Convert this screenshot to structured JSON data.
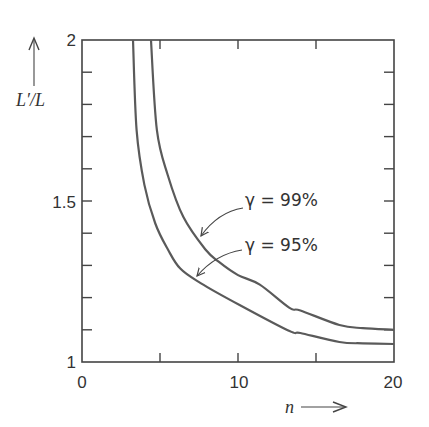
{
  "chart_data": {
    "type": "line",
    "title": "",
    "xlabel": "n",
    "ylabel": "L'/L",
    "xlim": [
      0,
      20
    ],
    "ylim": [
      1,
      2
    ],
    "x_ticks": [
      0,
      5,
      10,
      15,
      20
    ],
    "x_tick_labels": [
      "0",
      "",
      "10",
      "",
      "20"
    ],
    "y_ticks": [
      1,
      1.1,
      1.2,
      1.3,
      1.4,
      1.5,
      1.6,
      1.7,
      1.8,
      1.9,
      2
    ],
    "y_tick_labels": [
      "1",
      "",
      "",
      "",
      "",
      "1.5",
      "",
      "",
      "",
      "",
      "2"
    ],
    "grid": false,
    "legend": "none (inline annotations with arrows)",
    "series": [
      {
        "name": "γ = 99%",
        "x": [
          4.42,
          4.8,
          5.5,
          6.5,
          7.9,
          8.8,
          10,
          11.4,
          13.3,
          14,
          16.5,
          18,
          20
        ],
        "y": [
          2.0,
          1.72,
          1.58,
          1.45,
          1.35,
          1.31,
          1.27,
          1.24,
          1.168,
          1.16,
          1.115,
          1.105,
          1.1
        ]
      },
      {
        "name": "γ = 95%",
        "x": [
          3.27,
          3.5,
          4.0,
          4.7,
          5.5,
          6.3,
          7.6,
          10.1,
          13.3,
          14,
          16.5,
          18,
          20
        ],
        "y": [
          2.0,
          1.72,
          1.55,
          1.43,
          1.35,
          1.29,
          1.245,
          1.177,
          1.096,
          1.09,
          1.062,
          1.058,
          1.056
        ]
      }
    ],
    "annotations": [
      {
        "text": "γ = 99%",
        "points_to_series": "γ = 99%",
        "target": [
          7.6,
          1.39
        ]
      },
      {
        "text": "γ = 95%",
        "points_to_series": "γ = 95%",
        "target": [
          7.3,
          1.27
        ]
      }
    ]
  },
  "labels": {
    "ylabel": "L′/L",
    "xlabel": "n",
    "y_1": "1",
    "y_15": "1.5",
    "y_2": "2",
    "x_0": "0",
    "x_10": "10",
    "x_20": "20",
    "anno_99": "γ = 99%",
    "anno_95": "γ = 95%"
  }
}
